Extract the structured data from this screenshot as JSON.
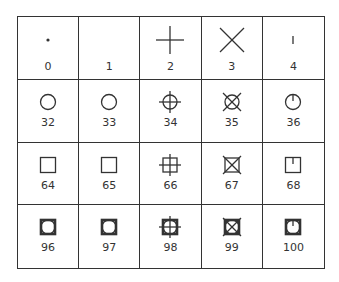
{
  "rows": [
    [
      {
        "code": "0",
        "symbol": "dot"
      },
      {
        "code": "1",
        "symbol": "none"
      },
      {
        "code": "2",
        "symbol": "plus"
      },
      {
        "code": "3",
        "symbol": "cross"
      },
      {
        "code": "4",
        "symbol": "tick"
      }
    ],
    [
      {
        "code": "32",
        "symbol": "circle"
      },
      {
        "code": "33",
        "symbol": "circle"
      },
      {
        "code": "34",
        "symbol": "circle-plus"
      },
      {
        "code": "35",
        "symbol": "circle-cross"
      },
      {
        "code": "36",
        "symbol": "circle-tick"
      }
    ],
    [
      {
        "code": "64",
        "symbol": "square"
      },
      {
        "code": "65",
        "symbol": "square"
      },
      {
        "code": "66",
        "symbol": "square-plus"
      },
      {
        "code": "67",
        "symbol": "square-cross"
      },
      {
        "code": "68",
        "symbol": "square-tick"
      }
    ],
    [
      {
        "code": "96",
        "symbol": "square-circle"
      },
      {
        "code": "97",
        "symbol": "square-circle"
      },
      {
        "code": "98",
        "symbol": "square-circle-plus"
      },
      {
        "code": "99",
        "symbol": "square-circle-cross"
      },
      {
        "code": "100",
        "symbol": "square-circle-tick"
      }
    ]
  ]
}
